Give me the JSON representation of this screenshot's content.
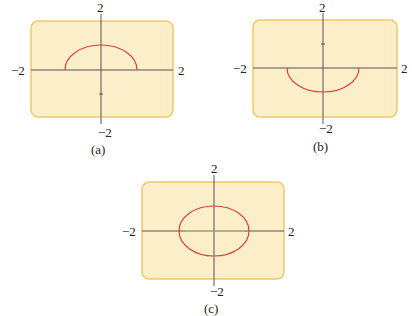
{
  "figure": {
    "panels": [
      {
        "id": "a",
        "caption": "(a)",
        "curve": "upper semicircle",
        "x_min": "−2",
        "x_max": "2",
        "y_min": "−2",
        "y_max": "2"
      },
      {
        "id": "b",
        "caption": "(b)",
        "curve": "lower semicircle",
        "x_min": "−2",
        "x_max": "2",
        "y_min": "−2",
        "y_max": "2"
      },
      {
        "id": "c",
        "caption": "(c)",
        "curve": "full ellipse",
        "x_min": "−2",
        "x_max": "2",
        "y_min": "−2",
        "y_max": "2"
      }
    ],
    "colors": {
      "panel_bg": "#fbeec9",
      "panel_border": "#f2c66a",
      "curve": "#d8413a",
      "axis": "#555555"
    }
  }
}
